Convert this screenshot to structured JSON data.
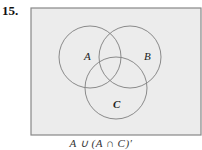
{
  "problem": {
    "number": "15.",
    "caption": "A ∪ (A ∩ C)′"
  },
  "diagram": {
    "universe": {
      "x": 31,
      "y": 8,
      "w": 170,
      "h": 127,
      "fill": "#ececec",
      "stroke": "#888888"
    },
    "circles": [
      {
        "label": "A",
        "cx": 90,
        "cy": 57,
        "r": 31,
        "label_x": 84,
        "label_y": 60
      },
      {
        "label": "B",
        "cx": 130,
        "cy": 57,
        "r": 31,
        "label_x": 144,
        "label_y": 60
      },
      {
        "label": "C",
        "cx": 116,
        "cy": 88,
        "r": 31,
        "label_x": 113,
        "label_y": 108
      }
    ],
    "circle_stroke": "#8a8a8a"
  }
}
